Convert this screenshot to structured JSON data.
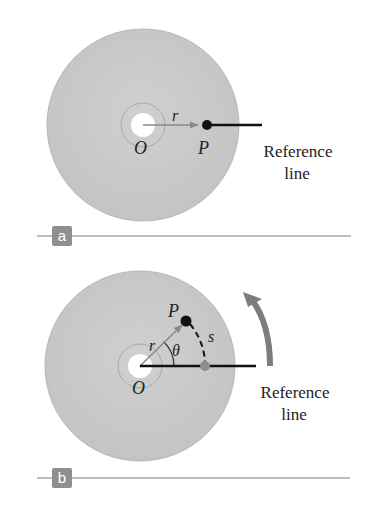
{
  "colors": {
    "disk": "#c9c9c9",
    "disk_edge": "#b5b5b5",
    "ring": "#a8a8a8",
    "hole": "#ffffff",
    "arrow": "#8a8a8a",
    "reference_line": "#111111",
    "point": "#111111",
    "projection_dot": "#8c8c8c",
    "rotation_arrow": "#7d7d7d",
    "divider": "#a9a9a9",
    "tag_bg": "#8f8f8f",
    "text": "#222222"
  },
  "panels": [
    {
      "id": "a",
      "tag": "a",
      "labels": {
        "origin": "O",
        "point": "P",
        "radius": "r",
        "reference_1": "Reference",
        "reference_2": "line"
      }
    },
    {
      "id": "b",
      "tag": "b",
      "labels": {
        "origin": "O",
        "point": "P",
        "radius": "r",
        "angle": "θ",
        "arc": "s",
        "reference_1": "Reference",
        "reference_2": "line"
      }
    }
  ]
}
